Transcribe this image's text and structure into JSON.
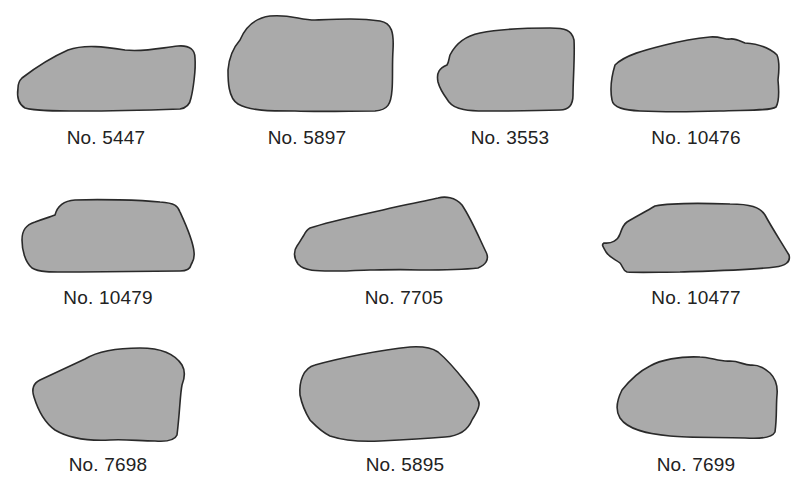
{
  "figure": {
    "fill_color": "#aaaaaa",
    "outline_color": "#2a2a2a",
    "specimens": [
      {
        "label": "No. 5447"
      },
      {
        "label": "No. 5897"
      },
      {
        "label": "No. 3553"
      },
      {
        "label": "No. 10476"
      },
      {
        "label": "No. 10479"
      },
      {
        "label": "No. 7705"
      },
      {
        "label": "No. 10477"
      },
      {
        "label": "No. 7698"
      },
      {
        "label": "No. 5895"
      },
      {
        "label": "No. 7699"
      }
    ]
  }
}
